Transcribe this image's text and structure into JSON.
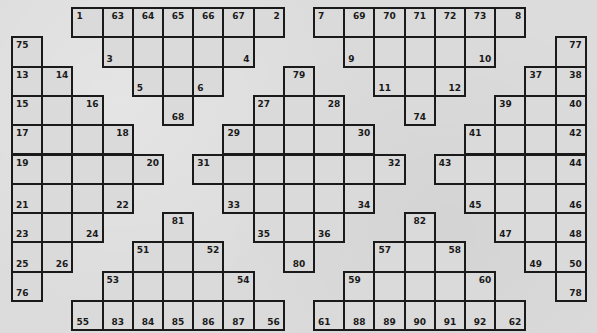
{
  "puzzle": {
    "type": "crossword",
    "grid": {
      "cols": 19,
      "rows": 11,
      "origin_x": 12,
      "origin_y": 8,
      "cell_w": 30.2,
      "cell_h": 29.3
    },
    "colors": {
      "background": "#dcdcdc",
      "cell": "#dadada",
      "line": "#1a1a1a",
      "number": "#1a1a1a"
    },
    "cells": [
      {
        "r": 0,
        "c": 2,
        "n": "1",
        "p": "tl"
      },
      {
        "r": 0,
        "c": 3,
        "n": "63",
        "p": "tc"
      },
      {
        "r": 0,
        "c": 4,
        "n": "64",
        "p": "tc"
      },
      {
        "r": 0,
        "c": 5,
        "n": "65",
        "p": "tc"
      },
      {
        "r": 0,
        "c": 6,
        "n": "66",
        "p": "tc"
      },
      {
        "r": 0,
        "c": 7,
        "n": "67",
        "p": "tc"
      },
      {
        "r": 0,
        "c": 8,
        "n": "2",
        "p": "tr"
      },
      {
        "r": 0,
        "c": 10,
        "n": "7",
        "p": "tl"
      },
      {
        "r": 0,
        "c": 11,
        "n": "69",
        "p": "tc"
      },
      {
        "r": 0,
        "c": 12,
        "n": "70",
        "p": "tc"
      },
      {
        "r": 0,
        "c": 13,
        "n": "71",
        "p": "tc"
      },
      {
        "r": 0,
        "c": 14,
        "n": "72",
        "p": "tc"
      },
      {
        "r": 0,
        "c": 15,
        "n": "73",
        "p": "tc"
      },
      {
        "r": 0,
        "c": 16,
        "n": "8",
        "p": "tr"
      },
      {
        "r": 1,
        "c": 0,
        "n": "75",
        "p": "tl"
      },
      {
        "r": 1,
        "c": 3,
        "n": "3",
        "p": "bl"
      },
      {
        "r": 1,
        "c": 4
      },
      {
        "r": 1,
        "c": 5
      },
      {
        "r": 1,
        "c": 6
      },
      {
        "r": 1,
        "c": 7,
        "n": "4",
        "p": "br"
      },
      {
        "r": 1,
        "c": 11,
        "n": "9",
        "p": "bl"
      },
      {
        "r": 1,
        "c": 12
      },
      {
        "r": 1,
        "c": 13
      },
      {
        "r": 1,
        "c": 14
      },
      {
        "r": 1,
        "c": 15,
        "n": "10",
        "p": "br"
      },
      {
        "r": 1,
        "c": 18,
        "n": "77",
        "p": "tr"
      },
      {
        "r": 2,
        "c": 0,
        "n": "13",
        "p": "tl"
      },
      {
        "r": 2,
        "c": 1,
        "n": "14",
        "p": "tr"
      },
      {
        "r": 2,
        "c": 4,
        "n": "5",
        "p": "bl"
      },
      {
        "r": 2,
        "c": 5
      },
      {
        "r": 2,
        "c": 6,
        "n": "6",
        "p": "bl"
      },
      {
        "r": 2,
        "c": 9,
        "n": "79",
        "p": "tc"
      },
      {
        "r": 2,
        "c": 12,
        "n": "11",
        "p": "bl"
      },
      {
        "r": 2,
        "c": 13
      },
      {
        "r": 2,
        "c": 14,
        "n": "12",
        "p": "br"
      },
      {
        "r": 2,
        "c": 17,
        "n": "37",
        "p": "tl"
      },
      {
        "r": 2,
        "c": 18,
        "n": "38",
        "p": "tr"
      },
      {
        "r": 3,
        "c": 0,
        "n": "15",
        "p": "tl"
      },
      {
        "r": 3,
        "c": 1
      },
      {
        "r": 3,
        "c": 2,
        "n": "16",
        "p": "tr"
      },
      {
        "r": 3,
        "c": 5,
        "n": "68",
        "p": "bc"
      },
      {
        "r": 3,
        "c": 8,
        "n": "27",
        "p": "tl"
      },
      {
        "r": 3,
        "c": 9
      },
      {
        "r": 3,
        "c": 10,
        "n": "28",
        "p": "tr"
      },
      {
        "r": 3,
        "c": 13,
        "n": "74",
        "p": "bc"
      },
      {
        "r": 3,
        "c": 16,
        "n": "39",
        "p": "tl"
      },
      {
        "r": 3,
        "c": 17
      },
      {
        "r": 3,
        "c": 18,
        "n": "40",
        "p": "tr"
      },
      {
        "r": 4,
        "c": 0,
        "n": "17",
        "p": "tl"
      },
      {
        "r": 4,
        "c": 1
      },
      {
        "r": 4,
        "c": 2
      },
      {
        "r": 4,
        "c": 3,
        "n": "18",
        "p": "tr"
      },
      {
        "r": 4,
        "c": 7,
        "n": "29",
        "p": "tl"
      },
      {
        "r": 4,
        "c": 8
      },
      {
        "r": 4,
        "c": 9
      },
      {
        "r": 4,
        "c": 10
      },
      {
        "r": 4,
        "c": 11,
        "n": "30",
        "p": "tr"
      },
      {
        "r": 4,
        "c": 15,
        "n": "41",
        "p": "tl"
      },
      {
        "r": 4,
        "c": 16
      },
      {
        "r": 4,
        "c": 17
      },
      {
        "r": 4,
        "c": 18,
        "n": "42",
        "p": "tr"
      },
      {
        "r": 5,
        "c": 0,
        "n": "19",
        "p": "tl"
      },
      {
        "r": 5,
        "c": 1
      },
      {
        "r": 5,
        "c": 2
      },
      {
        "r": 5,
        "c": 3
      },
      {
        "r": 5,
        "c": 4,
        "n": "20",
        "p": "tr"
      },
      {
        "r": 5,
        "c": 6,
        "n": "31",
        "p": "tl"
      },
      {
        "r": 5,
        "c": 7
      },
      {
        "r": 5,
        "c": 8
      },
      {
        "r": 5,
        "c": 9
      },
      {
        "r": 5,
        "c": 10
      },
      {
        "r": 5,
        "c": 11
      },
      {
        "r": 5,
        "c": 12,
        "n": "32",
        "p": "tr"
      },
      {
        "r": 5,
        "c": 14,
        "n": "43",
        "p": "tl"
      },
      {
        "r": 5,
        "c": 15
      },
      {
        "r": 5,
        "c": 16
      },
      {
        "r": 5,
        "c": 17
      },
      {
        "r": 5,
        "c": 18,
        "n": "44",
        "p": "tr"
      },
      {
        "r": 6,
        "c": 0,
        "n": "21",
        "p": "bl"
      },
      {
        "r": 6,
        "c": 1
      },
      {
        "r": 6,
        "c": 2
      },
      {
        "r": 6,
        "c": 3,
        "n": "22",
        "p": "br"
      },
      {
        "r": 6,
        "c": 7,
        "n": "33",
        "p": "bl"
      },
      {
        "r": 6,
        "c": 8
      },
      {
        "r": 6,
        "c": 9
      },
      {
        "r": 6,
        "c": 10
      },
      {
        "r": 6,
        "c": 11,
        "n": "34",
        "p": "br"
      },
      {
        "r": 6,
        "c": 15,
        "n": "45",
        "p": "bl"
      },
      {
        "r": 6,
        "c": 16
      },
      {
        "r": 6,
        "c": 17
      },
      {
        "r": 6,
        "c": 18,
        "n": "46",
        "p": "br"
      },
      {
        "r": 7,
        "c": 0,
        "n": "23",
        "p": "bl"
      },
      {
        "r": 7,
        "c": 1
      },
      {
        "r": 7,
        "c": 2,
        "n": "24",
        "p": "br"
      },
      {
        "r": 7,
        "c": 5,
        "n": "81",
        "p": "tc"
      },
      {
        "r": 7,
        "c": 8,
        "n": "35",
        "p": "bl"
      },
      {
        "r": 7,
        "c": 9
      },
      {
        "r": 7,
        "c": 10,
        "n": "36",
        "p": "bl"
      },
      {
        "r": 7,
        "c": 13,
        "n": "82",
        "p": "tc"
      },
      {
        "r": 7,
        "c": 16,
        "n": "47",
        "p": "bl"
      },
      {
        "r": 7,
        "c": 17
      },
      {
        "r": 7,
        "c": 18,
        "n": "48",
        "p": "br"
      },
      {
        "r": 8,
        "c": 0,
        "n": "25",
        "p": "bl"
      },
      {
        "r": 8,
        "c": 1,
        "n": "26",
        "p": "br"
      },
      {
        "r": 8,
        "c": 4,
        "n": "51",
        "p": "tl"
      },
      {
        "r": 8,
        "c": 5
      },
      {
        "r": 8,
        "c": 6,
        "n": "52",
        "p": "tr"
      },
      {
        "r": 8,
        "c": 9,
        "n": "80",
        "p": "bc"
      },
      {
        "r": 8,
        "c": 12,
        "n": "57",
        "p": "tl"
      },
      {
        "r": 8,
        "c": 13
      },
      {
        "r": 8,
        "c": 14,
        "n": "58",
        "p": "tr"
      },
      {
        "r": 8,
        "c": 17,
        "n": "49",
        "p": "bl"
      },
      {
        "r": 8,
        "c": 18,
        "n": "50",
        "p": "br"
      },
      {
        "r": 9,
        "c": 0,
        "n": "76",
        "p": "bl"
      },
      {
        "r": 9,
        "c": 3,
        "n": "53",
        "p": "tl"
      },
      {
        "r": 9,
        "c": 4
      },
      {
        "r": 9,
        "c": 5
      },
      {
        "r": 9,
        "c": 6
      },
      {
        "r": 9,
        "c": 7,
        "n": "54",
        "p": "tr"
      },
      {
        "r": 9,
        "c": 11,
        "n": "59",
        "p": "tl"
      },
      {
        "r": 9,
        "c": 12
      },
      {
        "r": 9,
        "c": 13
      },
      {
        "r": 9,
        "c": 14
      },
      {
        "r": 9,
        "c": 15,
        "n": "60",
        "p": "tr"
      },
      {
        "r": 9,
        "c": 18,
        "n": "78",
        "p": "br"
      },
      {
        "r": 10,
        "c": 2,
        "n": "55",
        "p": "bl"
      },
      {
        "r": 10,
        "c": 3,
        "n": "83",
        "p": "bc"
      },
      {
        "r": 10,
        "c": 4,
        "n": "84",
        "p": "bc"
      },
      {
        "r": 10,
        "c": 5,
        "n": "85",
        "p": "bc"
      },
      {
        "r": 10,
        "c": 6,
        "n": "86",
        "p": "bc"
      },
      {
        "r": 10,
        "c": 7,
        "n": "87",
        "p": "bc"
      },
      {
        "r": 10,
        "c": 8,
        "n": "56",
        "p": "br"
      },
      {
        "r": 10,
        "c": 10,
        "n": "61",
        "p": "bl"
      },
      {
        "r": 10,
        "c": 11,
        "n": "88",
        "p": "bc"
      },
      {
        "r": 10,
        "c": 12,
        "n": "89",
        "p": "bc"
      },
      {
        "r": 10,
        "c": 13,
        "n": "90",
        "p": "bc"
      },
      {
        "r": 10,
        "c": 14,
        "n": "91",
        "p": "bc"
      },
      {
        "r": 10,
        "c": 15,
        "n": "92",
        "p": "bc"
      },
      {
        "r": 10,
        "c": 16,
        "n": "62",
        "p": "br"
      }
    ]
  }
}
